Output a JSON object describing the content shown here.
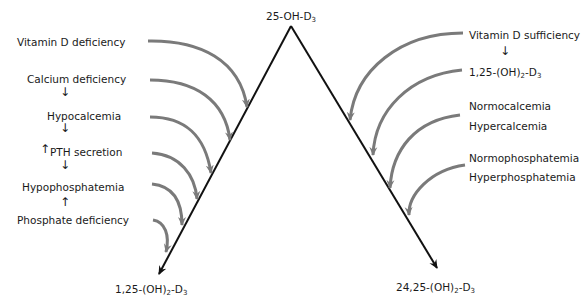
{
  "diagram": {
    "apex": {
      "text": "25-OH-D",
      "sub": "3"
    },
    "left_product": {
      "pre": "1,25-(OH)",
      "sub1": "2",
      "mid": "-D",
      "sub2": "3"
    },
    "right_product": {
      "pre": "24,25-(OH)",
      "sub1": "2",
      "mid": "-D",
      "sub2": "3"
    },
    "left_conditions": [
      "Vitamin D deficiency",
      "Calcium deficiency",
      "Hypocalcemia",
      "PTH secretion",
      "Hypophosphatemia",
      "Phosphate deficiency"
    ],
    "left_small_arrows": [
      "down",
      "down",
      "up",
      "down",
      "up"
    ],
    "right_conditions": {
      "vit_d": "Vitamin D sufficiency",
      "dihydroxy": {
        "pre": "1,25-(OH)",
        "sub1": "2",
        "mid": "-D",
        "sub2": "3"
      },
      "normocalcemia": "Normocalcemia",
      "hypercalcemia": "Hypercalcemia",
      "normophosphatemia": "Normophosphatemia",
      "hyperphosphatemia": "Hyperphosphatemia"
    },
    "colors": {
      "main_line": "#111111",
      "curve": "#7a7a7a"
    }
  }
}
